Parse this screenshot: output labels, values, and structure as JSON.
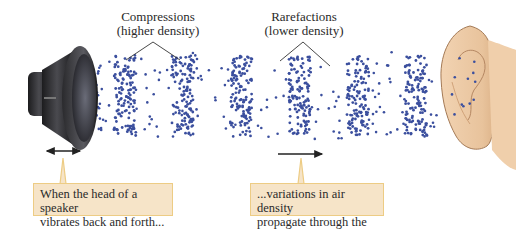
{
  "diagram": {
    "labels": {
      "compressions": {
        "line1": "Compressions",
        "line2": "(higher density)"
      },
      "rarefactions": {
        "line1": "Rarefactions",
        "line2": "(lower density)"
      }
    },
    "callouts": {
      "speaker": {
        "line1": "When the head of a speaker",
        "line2": "vibrates back and forth..."
      },
      "air": {
        "line1": "...variations in air density",
        "line2": "propagate through the air"
      }
    },
    "icons": {
      "source": "speaker-icon",
      "receiver": "ear-icon",
      "vibration": "double-arrow-icon",
      "propagation": "right-arrow-icon"
    },
    "colors": {
      "particle": "#3b4f9e",
      "callout_fill": "#f6e4c8",
      "callout_border": "#edcc84",
      "speaker_body": "#2b2b2e",
      "ear_skin": "#ecc9a4",
      "text": "#2a2a2a"
    },
    "wave": {
      "compression_count": 6,
      "particle_color_name": "blue"
    }
  }
}
